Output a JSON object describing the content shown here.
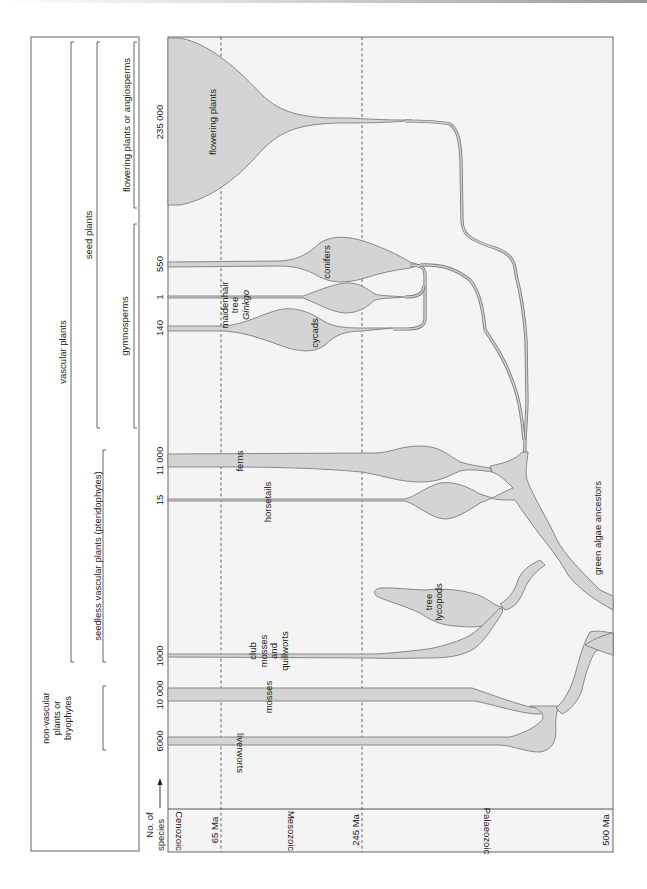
{
  "figure": {
    "orientation": "rotated 90 degrees clockwise (time axis runs right-to-left, read with page turned)",
    "header_arrow_label_1": "No. of",
    "header_arrow_label_2": "species",
    "time_axis": {
      "eras": [
        {
          "name": "Cenozoic",
          "label": "Cenozoic"
        },
        {
          "name": "Mesozoic",
          "label": "Mesozoic"
        },
        {
          "name": "Palaeozoic",
          "label": "Palaeozoic"
        }
      ],
      "boundaries": [
        {
          "label": "65 Ma",
          "value_ma": 65
        },
        {
          "label": "245 Ma",
          "value_ma": 245
        },
        {
          "label": "500 Ma",
          "value_ma": 500
        }
      ]
    },
    "groups": {
      "vascular": "vascular plants",
      "seed": "seed plants",
      "angiosperms": "flowering plants or angiosperms",
      "gymnosperms": "gymnosperms",
      "pteridophytes": "seedless vascular plants (pteridophytes)",
      "bryophytes_1": "non-vascular",
      "bryophytes_2": "plants or",
      "bryophytes_3": "bryophytes"
    },
    "lineages": [
      {
        "id": "flowering",
        "label": "flowering plants",
        "species": "235 000"
      },
      {
        "id": "conifers",
        "label": "conifers",
        "species": "550"
      },
      {
        "id": "ginkgo",
        "label_1": "maidenhair",
        "label_2": "tree",
        "label_3": "Ginkgo",
        "species": "1"
      },
      {
        "id": "cycads",
        "label": "cycads",
        "species": "140"
      },
      {
        "id": "ferns",
        "label": "ferns",
        "species": "11 000"
      },
      {
        "id": "horsetails",
        "label": "horsetails",
        "species": "15"
      },
      {
        "id": "tree-lycopods",
        "label_1": "tree",
        "label_2": "lycopods",
        "species": ""
      },
      {
        "id": "club-mosses",
        "label_1": "club",
        "label_2": "mosses",
        "label_3": "and",
        "label_4": "quillworts",
        "species": "1000"
      },
      {
        "id": "mosses",
        "label": "mosses",
        "species": "10 000"
      },
      {
        "id": "liverworts",
        "label": "liverworts",
        "species": "6000"
      }
    ],
    "root_label": "green algae ancestors"
  },
  "colors": {
    "clade_fill": "#d4d4d4",
    "clade_stroke": "#7d7d7d",
    "frame_bg": "#f4f4f4",
    "text": "#222222"
  }
}
